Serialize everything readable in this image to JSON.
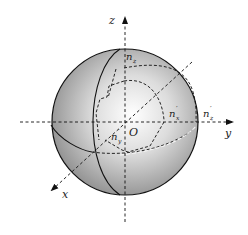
{
  "diagram": {
    "title": "",
    "type": "index-sphere-3d-axes",
    "colors": {
      "sphere_highlight": "#ffffff",
      "sphere_mid": "#cfcfcf",
      "sphere_edge": "#8a8a8a",
      "line": "#1a1a1a",
      "white_dash": "#f2f2f2"
    },
    "axes": {
      "x": "x",
      "y": "y",
      "z": "z"
    },
    "origin": "O",
    "labels": {
      "nz_prime": "n′z",
      "nx_prime": "n′x",
      "ny_prime": "n′y",
      "ny_axis_prime": "n′z"
    },
    "label_parts": {
      "nz_top": {
        "base": "n",
        "prime": "′",
        "sub": "z"
      },
      "nx_inner": {
        "base": "n",
        "prime": "′",
        "sub": "x"
      },
      "ny_inner": {
        "base": "n",
        "prime": "′",
        "sub": "y"
      },
      "n_on_y_axis": {
        "base": "n",
        "prime": "′",
        "sub": "z"
      }
    }
  }
}
